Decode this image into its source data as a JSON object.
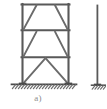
{
  "figure": {
    "label_a": "a)",
    "label_b": "",
    "colors": {
      "member": "#595959",
      "member_light": "#7d7d7d",
      "brace": "#6b6b6b",
      "ground_line": "#4a4a4a",
      "hatch": "#6f6f6f",
      "caption_text": "#8e8e8e",
      "background": "#ffffff"
    },
    "canvas": {
      "width": 106,
      "height": 109
    },
    "frame_a": {
      "name": "three-story-braced-frame",
      "left_column_x": 22,
      "right_column_x": 68,
      "roof_y": 4,
      "floor3_y": 30,
      "floor2_y": 57,
      "base_y": 84,
      "stories": [
        {
          "name": "top-story",
          "brace_type": "trapezoid",
          "top_y": 4,
          "bottom_y": 30
        },
        {
          "name": "middle-story",
          "brace_type": "trapezoid",
          "top_y": 30,
          "bottom_y": 57
        },
        {
          "name": "bottom-story",
          "brace_type": "chevron",
          "top_y": 57,
          "bottom_y": 84
        }
      ],
      "supports": [
        {
          "name": "left-fixed-support",
          "x": 22,
          "y": 84
        },
        {
          "name": "right-fixed-support",
          "x": 68,
          "y": 84
        }
      ]
    },
    "frame_b_partial": {
      "name": "adjacent-frame-partial",
      "column_x": 97,
      "top_y": 6,
      "base_y": 85,
      "cut_off": true
    },
    "ground": {
      "name": "ground-hatching",
      "line_start_x": 12,
      "line_end_x": 76,
      "y": 84,
      "hatch_count": 21,
      "hatch_length": 5
    }
  }
}
